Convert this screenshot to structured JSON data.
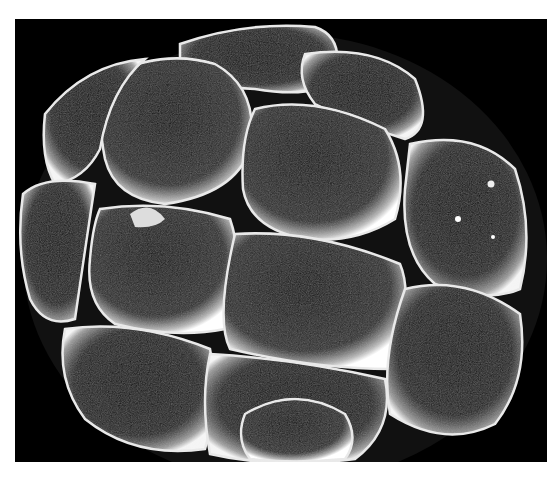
{
  "image": {
    "subject": "scanning electron micrograph of early embryo",
    "description": "Spherical multicellular embryo composed of rounded, textured cells on a black background",
    "cell_count_visible": 13,
    "colors": {
      "background": "#000000",
      "page": "#ffffff",
      "highlight": "#f2f2f2",
      "cell_body": "#1a1a1a"
    }
  }
}
